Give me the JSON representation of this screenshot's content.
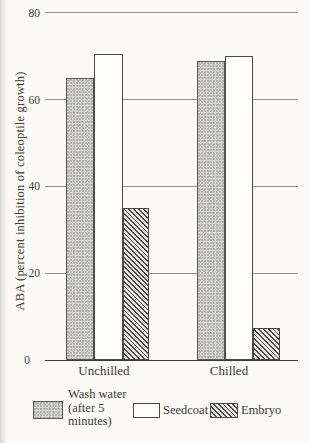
{
  "chart_data": {
    "type": "bar",
    "categories": [
      "Unchilled",
      "Chilled"
    ],
    "series": [
      {
        "name": "Wash water (after 5 minutes)",
        "pattern": "stipple",
        "values": [
          65,
          69
        ]
      },
      {
        "name": "Seedcoat",
        "pattern": "plain-white",
        "values": [
          70.5,
          70
        ]
      },
      {
        "name": "Embryo",
        "pattern": "diagonal-hatch",
        "values": [
          35,
          7.5
        ]
      }
    ],
    "title": "",
    "xlabel": "",
    "ylabel": "ABA (percent inhibition of coleoptile growth)",
    "ylim": [
      0,
      80
    ],
    "yticks": [
      0,
      20,
      40,
      60,
      80
    ],
    "grid": true,
    "legend_position": "bottom"
  },
  "y_axis": {
    "title": "ABA (percent inhibition of coleoptile growth)",
    "tick_labels": [
      "0",
      "20",
      "40",
      "60",
      "80"
    ]
  },
  "x_axis": {
    "categories": [
      "Unchilled",
      "Chilled"
    ]
  },
  "legend": {
    "wash_water": {
      "lines": [
        "Wash water",
        "(after 5",
        "minutes)"
      ]
    },
    "seedcoat": {
      "label": "Seedcoat"
    },
    "embryo": {
      "label": "Embryo"
    }
  },
  "colors": {
    "ink": "#3c3a37",
    "gridline": "#8e8e8c",
    "baseline": "#3b3936",
    "paper": "#fbfaf7",
    "stipple_fill": "#d8d8d5"
  }
}
